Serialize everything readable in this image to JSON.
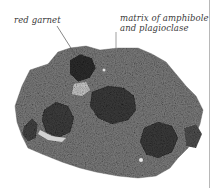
{
  "annotations": {
    "garnet": "red garnet",
    "matrix_line1": "matrix of amphibole",
    "matrix_line2": "and plagioclase"
  },
  "colors": {
    "background": "#ffffff",
    "rock_base": "#7a7a7a",
    "garnet": "#3a3a3a",
    "label_text": "#3a3a3a",
    "leader_line": "#555555"
  }
}
